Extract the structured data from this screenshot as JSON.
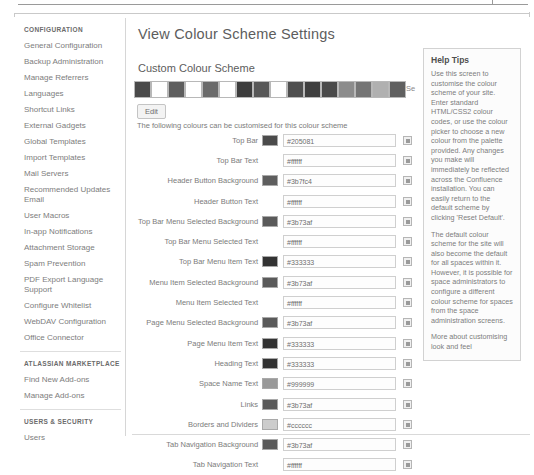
{
  "sidebar": {
    "sections": [
      {
        "heading": "CONFIGURATION",
        "items": [
          {
            "label": "General Configuration"
          },
          {
            "label": "Backup Administration"
          },
          {
            "label": "Manage Referrers"
          },
          {
            "label": "Languages"
          },
          {
            "label": "Shortcut Links"
          },
          {
            "label": "External Gadgets"
          },
          {
            "label": "Global Templates"
          },
          {
            "label": "Import Templates"
          },
          {
            "label": "Mail Servers"
          },
          {
            "label": "Recommended Updates Email"
          },
          {
            "label": "User Macros"
          },
          {
            "label": "In-app Notifications"
          },
          {
            "label": "Attachment Storage"
          },
          {
            "label": "Spam Prevention"
          },
          {
            "label": "PDF Export Language Support"
          },
          {
            "label": "Configure Whitelist"
          },
          {
            "label": "WebDAV Configuration"
          },
          {
            "label": "Office Connector"
          }
        ]
      },
      {
        "heading": "ATLASSIAN MARKETPLACE",
        "items": [
          {
            "label": "Find New Add-ons"
          },
          {
            "label": "Manage Add-ons"
          }
        ]
      },
      {
        "heading": "USERS & SECURITY",
        "items": [
          {
            "label": "Users"
          }
        ]
      }
    ]
  },
  "main": {
    "page_title": "View Colour Scheme Settings",
    "section_title": "Custom Colour Scheme",
    "scheme_description": "A custom colour scheme which can be edited",
    "edit_label": "Edit",
    "strip_cut_label": "Se",
    "table_description": "The following colours can be customised for this colour scheme",
    "preview_swatches": [
      "#4a4a4a",
      "#ffffff",
      "#5e5e5e",
      "#ffffff",
      "#6b6b6b",
      "#ffffff",
      "#3d3d3d",
      "#585858",
      "#ffffff",
      "#4f4f4f",
      "#3f3f3f",
      "#4a4a4a",
      "#8c8c8c",
      "#757575",
      "#b0b0b0",
      "#606060",
      "#ffffff",
      "#4a4a4a",
      "#ffffff"
    ],
    "rows": [
      {
        "label": "Top Bar",
        "swatch": "#4b4b4b",
        "value": "#205081",
        "has_swatch": true
      },
      {
        "label": "Top Bar Text",
        "swatch": "#ffffff",
        "value": "#ffffff",
        "has_swatch": false
      },
      {
        "label": "Header Button Background",
        "swatch": "#5e5e5e",
        "value": "#3b7fc4",
        "has_swatch": true
      },
      {
        "label": "Header Button Text",
        "swatch": "#ffffff",
        "value": "#ffffff",
        "has_swatch": false
      },
      {
        "label": "Top Bar Menu Selected Background",
        "swatch": "#5a5a5a",
        "value": "#3b73af",
        "has_swatch": true
      },
      {
        "label": "Top Bar Menu Selected Text",
        "swatch": "#ffffff",
        "value": "#ffffff",
        "has_swatch": false
      },
      {
        "label": "Top Bar Menu Item Text",
        "swatch": "#333333",
        "value": "#333333",
        "has_swatch": true
      },
      {
        "label": "Menu Item Selected Background",
        "swatch": "#5a5a5a",
        "value": "#3b73af",
        "has_swatch": true
      },
      {
        "label": "Menu Item Selected Text",
        "swatch": "#ffffff",
        "value": "#ffffff",
        "has_swatch": false
      },
      {
        "label": "Page Menu Selected Background",
        "swatch": "#5a5a5a",
        "value": "#3b73af",
        "has_swatch": true
      },
      {
        "label": "Page Menu Item Text",
        "swatch": "#333333",
        "value": "#333333",
        "has_swatch": true
      },
      {
        "label": "Heading Text",
        "swatch": "#333333",
        "value": "#333333",
        "has_swatch": true
      },
      {
        "label": "Space Name Text",
        "swatch": "#999999",
        "value": "#999999",
        "has_swatch": true
      },
      {
        "label": "Links",
        "swatch": "#5a5a5a",
        "value": "#3b73af",
        "has_swatch": true
      },
      {
        "label": "Borders and Dividers",
        "swatch": "#cccccc",
        "value": "#cccccc",
        "has_swatch": true
      },
      {
        "label": "Tab Navigation Background",
        "swatch": "#5a5a5a",
        "value": "#3b73af",
        "has_swatch": true
      },
      {
        "label": "Tab Navigation Text",
        "swatch": "#ffffff",
        "value": "#ffffff",
        "has_swatch": false
      }
    ]
  },
  "help": {
    "title": "Help Tips",
    "paragraphs": [
      "Use this screen to customise the colour scheme of your site. Enter standard HTML/CSS2 colour codes, or use the colour picker to choose a new colour from the palette provided. Any changes you make will immediately be reflected across the Confluence installation. You can easily return to the default scheme by clicking 'Reset Default'.",
      "The default colour scheme for the site will also become the default for all spaces within it. However, it is possible for space administrators to configure a different colour scheme for spaces from the space administration screens.",
      "More about customising look and feel"
    ]
  }
}
